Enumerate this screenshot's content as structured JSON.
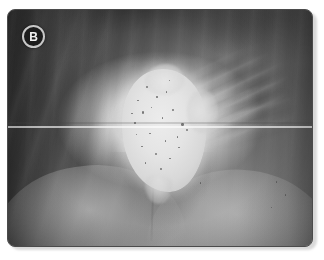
{
  "figure": {
    "panel_label": "B",
    "modality": "grayscale-radiograph",
    "caption": "",
    "badge": {
      "letter": "B",
      "fill_color": "#1c1c1c",
      "ring_color": "#c7c7c7",
      "text_color": "#f2f2f2"
    },
    "frame": {
      "border_color": "#4b4b4b",
      "corner_radius_px": 8,
      "background_color": "#ffffff",
      "shadow_color": "#d9d9d9"
    },
    "palette": {
      "lesion_bright": "#e4e4e4",
      "mid_gray": "#8a8a8a",
      "dark_gray": "#4a4a4a",
      "canopy_shadow": "#2e2e2e",
      "speckle": "#4e4e4e",
      "scanline": "#ffffff"
    },
    "features": [
      {
        "name": "central-bright-lesion",
        "position": "center",
        "appearance": "lobulated hyperdense mass with punctate dark speckles"
      },
      {
        "name": "rib-striations",
        "position": "upper-right",
        "appearance": "oblique parallel linear densities"
      },
      {
        "name": "drape-folds",
        "position": "left",
        "appearance": "vertical and oblique soft-tissue fold shadows"
      },
      {
        "name": "converging-drape",
        "position": "bottom",
        "appearance": "V-shaped converging contours meeting at midline"
      },
      {
        "name": "scanline-artifact",
        "position": "mid-height",
        "appearance": "thin bright horizontal line spanning full width"
      }
    ],
    "speckles": [
      {
        "x": 45.5,
        "y": 32.0,
        "r": 1.0
      },
      {
        "x": 48.8,
        "y": 36.5,
        "r": 0.8
      },
      {
        "x": 42.5,
        "y": 38.0,
        "r": 0.9
      },
      {
        "x": 52.0,
        "y": 34.5,
        "r": 0.7
      },
      {
        "x": 44.0,
        "y": 43.0,
        "r": 1.1
      },
      {
        "x": 50.5,
        "y": 45.5,
        "r": 0.8
      },
      {
        "x": 47.0,
        "y": 41.0,
        "r": 0.7
      },
      {
        "x": 54.0,
        "y": 42.0,
        "r": 0.9
      },
      {
        "x": 41.5,
        "y": 47.5,
        "r": 0.8
      },
      {
        "x": 57.0,
        "y": 48.0,
        "r": 1.2
      },
      {
        "x": 46.5,
        "y": 52.0,
        "r": 0.8
      },
      {
        "x": 51.5,
        "y": 55.0,
        "r": 0.9
      },
      {
        "x": 43.8,
        "y": 57.5,
        "r": 0.7
      },
      {
        "x": 55.5,
        "y": 53.5,
        "r": 0.8
      },
      {
        "x": 48.5,
        "y": 60.5,
        "r": 1.0
      },
      {
        "x": 53.0,
        "y": 62.5,
        "r": 0.8
      },
      {
        "x": 45.0,
        "y": 64.5,
        "r": 0.7
      },
      {
        "x": 50.0,
        "y": 67.0,
        "r": 0.9
      },
      {
        "x": 56.0,
        "y": 58.0,
        "r": 0.7
      },
      {
        "x": 42.0,
        "y": 52.5,
        "r": 0.6
      },
      {
        "x": 58.5,
        "y": 50.5,
        "r": 1.0
      },
      {
        "x": 40.5,
        "y": 43.5,
        "r": 0.7
      },
      {
        "x": 52.8,
        "y": 29.5,
        "r": 0.7
      },
      {
        "x": 88.0,
        "y": 72.5,
        "r": 0.9
      },
      {
        "x": 91.0,
        "y": 78.0,
        "r": 0.8
      },
      {
        "x": 86.5,
        "y": 83.5,
        "r": 0.7
      },
      {
        "x": 63.0,
        "y": 73.0,
        "r": 0.8
      }
    ]
  }
}
